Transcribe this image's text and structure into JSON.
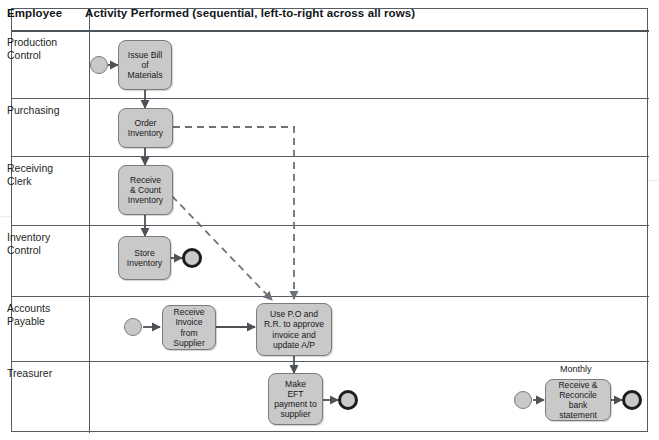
{
  "table": {
    "columns": [
      {
        "key": "employee",
        "label": "Employee"
      },
      {
        "key": "activity",
        "label": "Activity Performed (sequential, left-to-right across all rows)"
      }
    ]
  },
  "lanes": [
    {
      "id": "production-control",
      "label": "Production\nControl"
    },
    {
      "id": "purchasing",
      "label": "Purchasing"
    },
    {
      "id": "receiving-clerk",
      "label": "Receiving Clerk"
    },
    {
      "id": "inventory-control",
      "label": "Inventory\nControl"
    },
    {
      "id": "accounts-payable",
      "label": "Accounts\nPayable"
    },
    {
      "id": "treasurer",
      "label": "Treasurer"
    }
  ],
  "nodes": {
    "issue_bom": "Issue Bill\nof\nMaterials",
    "order_inventory": "Order\nInventory",
    "receive_count": "Receive\n& Count\nInventory",
    "store_inventory": "Store\nInventory",
    "receive_invoice": "Receive\nInvoice from\nSupplier",
    "approve_invoice": "Use P.O and\nR.R. to approve\ninvoice and\nupdate A/P",
    "make_eft": "Make\nEFT\npayment to\nsupplier",
    "reconcile_bank": "Receive  &\nReconcile bank\nstatement"
  },
  "annotations": {
    "monthly": "Monthly"
  },
  "colors": {
    "node_fill": "#c9c9c9",
    "node_border": "#7b7b7b",
    "line": "#555c63",
    "connector": "#4d5257",
    "text": "#17191c",
    "end_marker_ring": "#1a1d20"
  }
}
